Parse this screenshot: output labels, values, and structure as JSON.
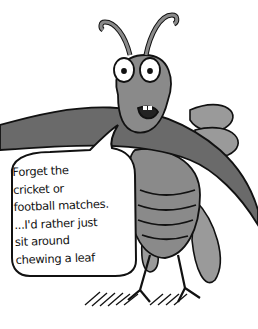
{
  "illustration": {
    "subject": "cartoon cricket insect clinging to a branch",
    "speech_bubble": {
      "lines": [
        "Forget the",
        "cricket or",
        "football matches.",
        "...I'd rather just",
        "sit around",
        "chewing a leaf"
      ]
    },
    "colors": {
      "insect_fill": "#8a8a8a",
      "insect_dark": "#5e5e5e",
      "outline": "#111111",
      "branch": "#6a6a6a",
      "background": "#ffffff"
    }
  }
}
